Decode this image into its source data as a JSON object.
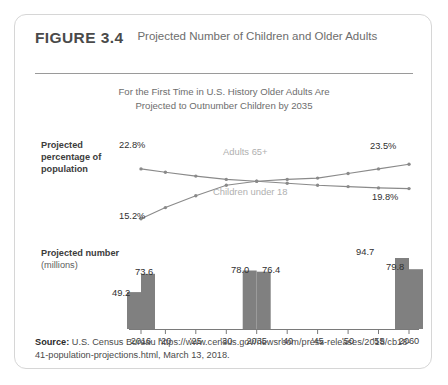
{
  "figure": {
    "number": "FIGURE 3.4",
    "title": "Projected Number of Children and Older Adults",
    "subtitle_line1": "For the First Time in U.S. History Older Adults Are",
    "subtitle_line2": "Projected to Outnumber Children by 2035"
  },
  "panels": {
    "line_axis_title_bold": "Projected percentage of population",
    "bar_axis_title_bold": "Projected number",
    "bar_axis_title_light": "(millions)"
  },
  "source": {
    "label": "Source:",
    "text": " U.S. Census Bureau https://www.census.gov/newsroom/press-releases/2018/cb18-41-population-projections.html, March 13, 2018."
  },
  "chart_data": [
    {
      "type": "line",
      "title": "Projected percentage of population",
      "xlabel": "",
      "ylabel": "Projected percentage of population",
      "ylim": [
        14,
        25
      ],
      "grid": false,
      "legend": "inline-labels",
      "x": [
        2016,
        2020,
        2025,
        2030,
        2035,
        2040,
        2045,
        2050,
        2055,
        2060
      ],
      "series": [
        {
          "name": "Children under 18",
          "values": [
            22.8,
            22.3,
            21.7,
            21.2,
            20.9,
            20.6,
            20.3,
            20.1,
            19.9,
            19.8
          ],
          "start_label": "22.8%",
          "end_label": "19.8%",
          "color": "#8a8a8a"
        },
        {
          "name": "Adults 65+",
          "values": [
            15.2,
            16.9,
            18.7,
            20.3,
            20.9,
            21.2,
            21.4,
            22.1,
            22.8,
            23.5
          ],
          "start_label": "15.2%",
          "end_label": "23.5%",
          "color": "#8a8a8a"
        }
      ]
    },
    {
      "type": "bar",
      "title": "Projected number (millions)",
      "xlabel": "",
      "ylabel": "Projected number (millions)",
      "ylim": [
        0,
        100
      ],
      "grid": false,
      "categories": [
        "2016",
        "2035",
        "2060"
      ],
      "series": [
        {
          "name": "Children under 18",
          "values": [
            73.6,
            76.4,
            79.8
          ],
          "color": "#808080"
        },
        {
          "name": "Adults 65+",
          "values": [
            49.2,
            78.0,
            94.7
          ],
          "color": "#808080"
        }
      ],
      "bar_labels": [
        "49.2",
        "73.6",
        "78.0",
        "76.4",
        "94.7",
        "79.8"
      ]
    }
  ],
  "x_axis": {
    "ticks": [
      "2016",
      "'20",
      "'25",
      "'30",
      "2035",
      "'40",
      "'45",
      "'50",
      "'55",
      "2060"
    ]
  },
  "colors": {
    "bar": "#808080",
    "line": "#8a8a8a",
    "series_label": "#b0b0b0",
    "card_border": "#d6d6d6",
    "rule": "#9a9a9a"
  }
}
